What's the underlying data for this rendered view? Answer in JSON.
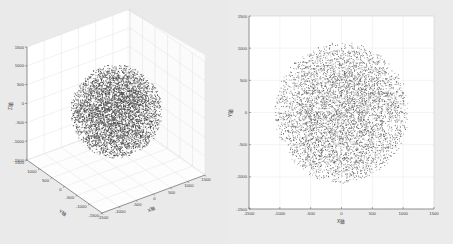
{
  "chart_data": [
    {
      "type": "scatter",
      "subtype": "scatter3d",
      "title": "",
      "description": "Uniform random points filling a sphere of radius ~1000 centered at origin, viewed in 3D",
      "xlabel": "X轴",
      "ylabel": "Y轴",
      "zlabel": "Z轴",
      "xlim": [
        -1500,
        1500
      ],
      "ylim": [
        -1500,
        1500
      ],
      "zlim": [
        -1500,
        1500
      ],
      "x_ticks": [
        -1500,
        -1000,
        -500,
        0,
        500,
        1000,
        1500
      ],
      "y_ticks": [
        -1500,
        -1000,
        -500,
        0,
        500,
        1000,
        1500
      ],
      "z_ticks": [
        -1500,
        -1000,
        -500,
        0,
        500,
        1000,
        1500
      ],
      "x_tick_labels": [
        "-1500",
        "-1000",
        "-500",
        "0",
        "500",
        "1000",
        "1500"
      ],
      "y_tick_labels": [
        "-1500",
        "-1000",
        "-500",
        "0",
        "500",
        "1000",
        "1500"
      ],
      "z_tick_labels": [
        "-1500",
        "-1000",
        "-500",
        "0",
        "500",
        "1000",
        "1500"
      ],
      "grid": true,
      "series": [
        {
          "name": "points",
          "shape": "sphere",
          "center": [
            0,
            0,
            0
          ],
          "radius": 1000,
          "point_count_approx": 8000,
          "marker": "dot",
          "color": "#3a3a3a"
        }
      ]
    },
    {
      "type": "scatter",
      "title": "",
      "description": "Top-down XY projection of the same sphere point cloud (denser at center)",
      "xlabel": "X轴",
      "ylabel": "Y轴",
      "xlim": [
        -1500,
        1500
      ],
      "ylim": [
        -1500,
        1500
      ],
      "x_ticks": [
        -1500,
        -1000,
        -500,
        0,
        500,
        1000,
        1500
      ],
      "y_ticks": [
        -1500,
        -1000,
        -500,
        0,
        500,
        1000,
        1500
      ],
      "x_tick_labels": [
        "-1500",
        "-1000",
        "-500",
        "0",
        "500",
        "1000",
        "1500"
      ],
      "y_tick_labels": [
        "-1500",
        "-1000",
        "-500",
        "0",
        "500",
        "1000",
        "1500"
      ],
      "grid": true,
      "series": [
        {
          "name": "points",
          "shape": "disk",
          "center": [
            0,
            0
          ],
          "radius": 1100,
          "point_count_approx": 8000,
          "marker": "dot",
          "color": "#3a3a3a"
        }
      ]
    }
  ],
  "plot3d": {
    "xlabel": "X轴",
    "ylabel": "Y轴",
    "zlabel": "Z轴",
    "z_tick_labels": [
      "1500",
      "1000",
      "500",
      "0",
      "-500",
      "-1000",
      "-1500"
    ],
    "y_tick_labels": [
      "1500",
      "1000",
      "500",
      "0",
      "-500",
      "-1000",
      "-1500"
    ],
    "x_tick_labels": [
      "-1500",
      "-1000",
      "-500",
      "0",
      "500",
      "1000",
      "1500"
    ]
  },
  "plot2d": {
    "xlabel": "X轴",
    "ylabel": "Y轴",
    "x_tick_labels": [
      "-1500",
      "-1000",
      "-500",
      "0",
      "500",
      "1000",
      "1500"
    ],
    "y_tick_labels": [
      "1500",
      "1000",
      "500",
      "0",
      "-500",
      "-1000",
      "-1500"
    ]
  },
  "colors": {
    "axis": "#555555",
    "grid": "#d8d8d8",
    "points": "#3a3a3a",
    "plot_bg": "#ffffff",
    "figure_bg": "#eaeaea"
  }
}
